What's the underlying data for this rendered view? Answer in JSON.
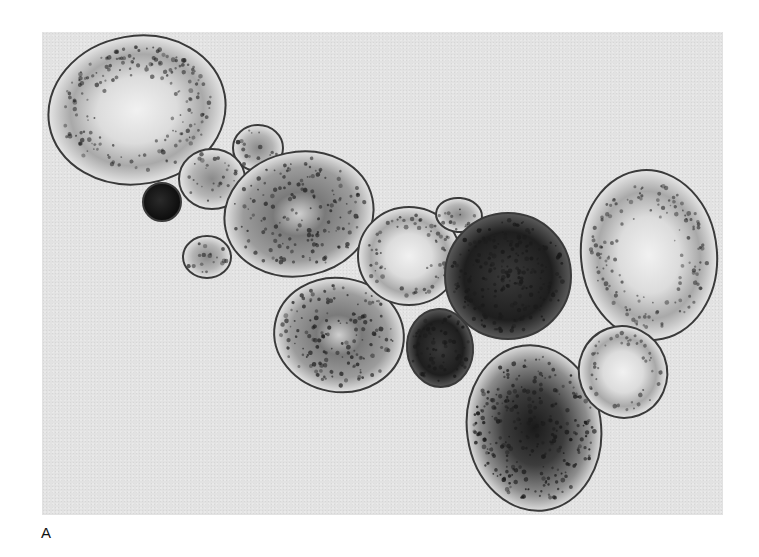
{
  "figure": {
    "panel_label": "A",
    "colors": {
      "background": "#e2e2e2",
      "cell_outline": "#3a3a3a",
      "cell_fill_light": "#e8e8e8",
      "granule_dark": "#1a1a1a"
    },
    "cells": [
      {
        "id": "large-top-left",
        "cx": 95,
        "cy": 78,
        "rx": 89,
        "ry": 74,
        "rot": -10,
        "density": 0.45,
        "center": "pale"
      },
      {
        "id": "small-top-1",
        "cx": 216,
        "cy": 116,
        "rx": 25,
        "ry": 23,
        "rot": 0,
        "density": 0.5,
        "center": "dotted"
      },
      {
        "id": "small-top-2",
        "cx": 170,
        "cy": 147,
        "rx": 33,
        "ry": 30,
        "rot": 0,
        "density": 0.5,
        "center": "dotted"
      },
      {
        "id": "tiny-dark",
        "cx": 120,
        "cy": 170,
        "rx": 19,
        "ry": 19,
        "rot": 0,
        "density": 1.0,
        "center": "solid"
      },
      {
        "id": "small-left",
        "cx": 165,
        "cy": 225,
        "rx": 24,
        "ry": 21,
        "rot": 0,
        "density": 0.55,
        "center": "dotted"
      },
      {
        "id": "oval-center-left",
        "cx": 257,
        "cy": 182,
        "rx": 75,
        "ry": 62,
        "rot": -12,
        "density": 0.55,
        "center": "streak"
      },
      {
        "id": "oval-lower-left",
        "cx": 297,
        "cy": 303,
        "rx": 65,
        "ry": 57,
        "rot": 10,
        "density": 0.65,
        "center": "streak"
      },
      {
        "id": "medium-center",
        "cx": 367,
        "cy": 224,
        "rx": 51,
        "ry": 49,
        "rot": 0,
        "density": 0.45,
        "center": "pale"
      },
      {
        "id": "tiny-top-center",
        "cx": 417,
        "cy": 183,
        "rx": 23,
        "ry": 17,
        "rot": 5,
        "density": 0.6,
        "center": "dotted"
      },
      {
        "id": "large-dark-center",
        "cx": 466,
        "cy": 244,
        "rx": 63,
        "ry": 63,
        "rot": 0,
        "density": 0.95,
        "center": "dark"
      },
      {
        "id": "small-dark",
        "cx": 398,
        "cy": 316,
        "rx": 33,
        "ry": 39,
        "rot": -5,
        "density": 0.9,
        "center": "dark"
      },
      {
        "id": "large-lower-dark",
        "cx": 492,
        "cy": 396,
        "rx": 67,
        "ry": 83,
        "rot": -8,
        "density": 0.8,
        "center": "dark-streak"
      },
      {
        "id": "large-right",
        "cx": 607,
        "cy": 223,
        "rx": 68,
        "ry": 85,
        "rot": -5,
        "density": 0.4,
        "center": "pale"
      },
      {
        "id": "medium-right",
        "cx": 581,
        "cy": 340,
        "rx": 44,
        "ry": 46,
        "rot": -20,
        "density": 0.35,
        "center": "pale"
      }
    ]
  }
}
